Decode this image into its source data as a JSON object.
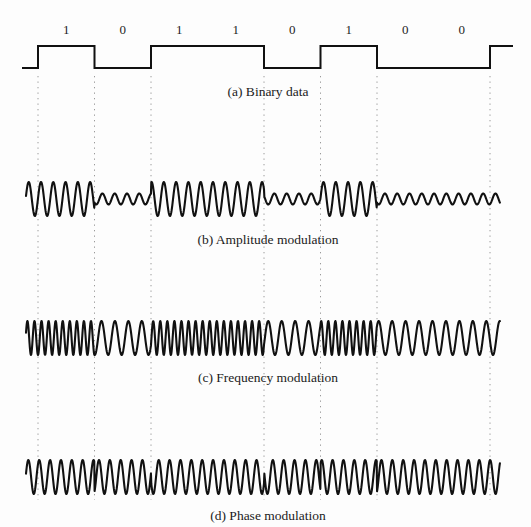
{
  "figure": {
    "background_color": "#fdfdfd",
    "ink_color": "#111111",
    "guide_color": "#9a9a9a"
  },
  "bit_sequence": {
    "values": [
      "1",
      "0",
      "1",
      "1",
      "0",
      "1",
      "0",
      "0"
    ],
    "count": 8,
    "cell_width_px": 56.5,
    "start_x_px": 38
  },
  "guides": {
    "description": "vertical dotted guide lines dropped at selected bit boundaries",
    "x_positions": [
      38,
      94.5,
      151,
      264,
      320.5,
      377,
      490
    ]
  },
  "panels": [
    {
      "id": "binary-data",
      "caption": "(a) Binary data",
      "caption_x": 268,
      "caption_y": 84,
      "type": "square-wave",
      "baseline_y": 68,
      "high_y": 46,
      "axis_top": 40,
      "axis_bottom": 76
    },
    {
      "id": "amplitude-modulation",
      "caption": "(b) Amplitude modulation",
      "caption_x": 268,
      "caption_y": 232,
      "type": "am",
      "center_y": 199,
      "cycles_per_bit": 4.6,
      "amp_one": 17,
      "amp_zero": 5.5
    },
    {
      "id": "frequency-modulation",
      "caption": "(c) Frequency modulation",
      "caption_x": 268,
      "caption_y": 370,
      "type": "fm",
      "center_y": 338,
      "amplitude": 17,
      "cycles_per_bit_one": 8,
      "cycles_per_bit_zero": 4.2
    },
    {
      "id": "phase-modulation",
      "caption": "(d) Phase modulation",
      "caption_x": 268,
      "caption_y": 508,
      "type": "pm",
      "center_y": 477,
      "amplitude": 17,
      "cycles_per_bit": 5.2,
      "phase_shift_deg": 180
    }
  ],
  "chart_data": {
    "type": "line",
    "xlabel": "",
    "ylabel": "",
    "categories": [
      "1",
      "0",
      "1",
      "1",
      "0",
      "1",
      "0",
      "0"
    ],
    "grid": false,
    "legend": "none",
    "series": [
      {
        "name": "(a) Binary data",
        "kind": "square-wave",
        "values": [
          1,
          0,
          1,
          1,
          0,
          1,
          0,
          0
        ]
      },
      {
        "name": "(b) Amplitude modulation",
        "kind": "am",
        "values": [
          1,
          0,
          1,
          1,
          0,
          1,
          0,
          0
        ],
        "amplitude_for_one": 1.0,
        "amplitude_for_zero": 0.32,
        "carrier_cycles_per_bit": 4.6
      },
      {
        "name": "(c) Frequency modulation",
        "kind": "fm",
        "values": [
          1,
          0,
          1,
          1,
          0,
          1,
          0,
          0
        ],
        "cycles_per_bit_for_one": 8,
        "cycles_per_bit_for_zero": 4.2,
        "amplitude": 1.0
      },
      {
        "name": "(d) Phase modulation",
        "kind": "pm",
        "values": [
          1,
          0,
          1,
          1,
          0,
          1,
          0,
          0
        ],
        "cycles_per_bit": 5.2,
        "phase_shift_degrees": 180,
        "amplitude": 1.0
      }
    ]
  }
}
